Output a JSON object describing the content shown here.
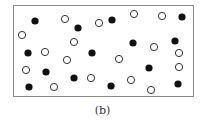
{
  "figure": {
    "caption": "(b)",
    "frame": {
      "x": 13,
      "y": 5,
      "width": 181,
      "height": 92
    },
    "colors": {
      "filled": "#111111",
      "open_stroke": "#333333",
      "open_fill": "#ffffff",
      "border": "#8a8a8a"
    },
    "particle_radius": 3.6,
    "filled_particles": [
      [
        35,
        21
      ],
      [
        78,
        28
      ],
      [
        112,
        20
      ],
      [
        182,
        17
      ],
      [
        133,
        43
      ],
      [
        175,
        41
      ],
      [
        28,
        53
      ],
      [
        92,
        53
      ],
      [
        149,
        68
      ],
      [
        46,
        72
      ],
      [
        74,
        78
      ],
      [
        178,
        84
      ],
      [
        29,
        87
      ],
      [
        111,
        86
      ]
    ],
    "open_particles": [
      [
        65,
        19
      ],
      [
        99,
        23
      ],
      [
        134,
        14
      ],
      [
        162,
        16
      ],
      [
        22,
        35
      ],
      [
        74,
        42
      ],
      [
        154,
        47
      ],
      [
        45,
        52
      ],
      [
        67,
        60
      ],
      [
        119,
        59
      ],
      [
        179,
        53
      ],
      [
        26,
        70
      ],
      [
        179,
        67
      ],
      [
        91,
        78
      ],
      [
        131,
        80
      ],
      [
        54,
        87
      ],
      [
        151,
        90
      ]
    ]
  }
}
